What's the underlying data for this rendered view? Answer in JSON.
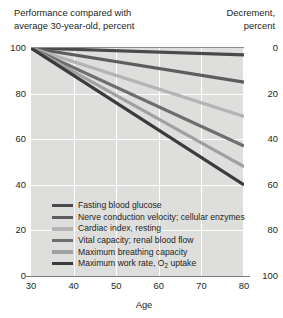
{
  "header": {
    "left_line1": "Performance compared with",
    "left_line2": "average 30-year-old, percent",
    "right_line1": "Decrement,",
    "right_line2": "percent"
  },
  "axes": {
    "x_title": "Age",
    "x_ticks": [
      "30",
      "40",
      "50",
      "60",
      "70",
      "80"
    ],
    "y_left_ticks": [
      "100",
      "80",
      "60",
      "40",
      "20",
      "0"
    ],
    "y_right_ticks": [
      "0",
      "20",
      "40",
      "60",
      "80",
      "100"
    ]
  },
  "legend": {
    "items": [
      {
        "label": "Fasting blood glucose",
        "color": "#4a4a4a"
      },
      {
        "label": "Nerve conduction velocity; cellular enzymes",
        "color": "#5d5d5d"
      },
      {
        "label": "Cardiac index, resting",
        "color": "#b4b4b4"
      },
      {
        "label": "Vital capacity; renal blood flow",
        "color": "#6e6e6e"
      },
      {
        "label": "Maximum breathing capacity",
        "color": "#a0a0a0"
      },
      {
        "label": "Maximum work rate, O2 uptake",
        "color": "#3b3b3b"
      }
    ]
  },
  "chart_data": {
    "type": "line",
    "title": "Performance compared with average 30-year-old, percent",
    "xlabel": "Age",
    "ylabel": "Performance compared with average 30-year-old, percent",
    "ylabel_right": "Decrement, percent",
    "xlim": [
      30,
      80
    ],
    "ylim": [
      0,
      100
    ],
    "ylim_right": [
      100,
      0
    ],
    "grid": true,
    "legend_position": "inside-bottom-left",
    "x": [
      30,
      80
    ],
    "series": [
      {
        "name": "Fasting blood glucose",
        "color": "#4a4a4a",
        "values": [
          100,
          97
        ]
      },
      {
        "name": "Nerve conduction velocity; cellular enzymes",
        "color": "#5d5d5d",
        "values": [
          100,
          85
        ]
      },
      {
        "name": "Cardiac index, resting",
        "color": "#b4b4b4",
        "values": [
          100,
          70
        ]
      },
      {
        "name": "Vital capacity; renal blood flow",
        "color": "#6e6e6e",
        "values": [
          100,
          57
        ]
      },
      {
        "name": "Maximum breathing capacity",
        "color": "#a0a0a0",
        "values": [
          100,
          48
        ]
      },
      {
        "name": "Maximum work rate, O2 uptake",
        "color": "#3b3b3b",
        "values": [
          100,
          40
        ]
      }
    ]
  }
}
